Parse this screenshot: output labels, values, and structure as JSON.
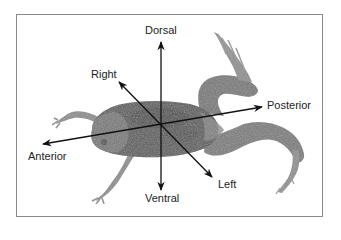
{
  "diagram": {
    "axes": {
      "dorsal": {
        "label": "Dorsal"
      },
      "ventral": {
        "label": "Ventral"
      },
      "right": {
        "label": "Right"
      },
      "left": {
        "label": "Left"
      },
      "anterior": {
        "label": "Anterior"
      },
      "posterior": {
        "label": "Posterior"
      }
    },
    "colors": {
      "frame": "#8a8a8a",
      "arrow": "#111111",
      "label": "#222222",
      "frog_dark": "#4a4a4a",
      "frog_mid": "#6e6e6e",
      "frog_light": "#9a9a9a"
    }
  }
}
